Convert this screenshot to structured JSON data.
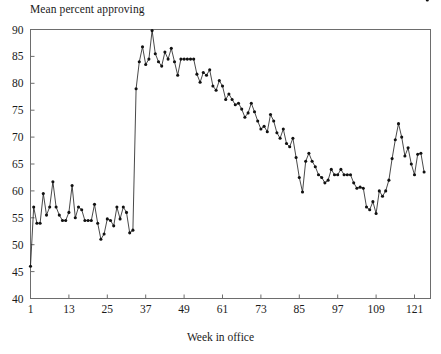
{
  "chart_data": {
    "type": "line",
    "title": "Mean percent approving",
    "xlabel": "Week in office",
    "ylabel": "",
    "grid": false,
    "legend": "none",
    "marker": "filled-circle",
    "xlim": [
      1,
      126
    ],
    "ylim": [
      40,
      90
    ],
    "xticks": [
      1,
      13,
      25,
      37,
      49,
      61,
      73,
      85,
      97,
      109,
      121
    ],
    "yticks": [
      40,
      45,
      50,
      55,
      60,
      65,
      70,
      75,
      80,
      85,
      90
    ],
    "x": [
      1,
      2,
      3,
      4,
      5,
      6,
      7,
      8,
      9,
      10,
      11,
      12,
      13,
      14,
      15,
      16,
      17,
      18,
      19,
      20,
      21,
      22,
      23,
      24,
      25,
      26,
      27,
      28,
      29,
      30,
      31,
      32,
      33,
      34,
      35,
      36,
      37,
      38,
      39,
      40,
      41,
      42,
      43,
      44,
      45,
      46,
      47,
      48,
      49,
      50,
      51,
      52,
      53,
      54,
      55,
      56,
      57,
      58,
      59,
      60,
      61,
      62,
      63,
      64,
      65,
      66,
      67,
      68,
      69,
      70,
      71,
      72,
      73,
      74,
      75,
      76,
      77,
      78,
      79,
      80,
      81,
      82,
      83,
      84,
      85,
      86,
      87,
      88,
      89,
      90,
      91,
      92,
      93,
      94,
      95,
      96,
      97,
      98,
      99,
      100,
      101,
      102,
      103,
      104,
      105,
      106,
      107,
      108,
      109,
      110,
      111,
      112,
      113,
      114,
      115,
      116,
      117,
      118,
      119,
      120,
      121,
      122,
      123,
      124,
      125
    ],
    "y": [
      46.0,
      57.0,
      54.0,
      54.0,
      59.5,
      55.5,
      57.0,
      61.7,
      57.0,
      55.5,
      54.5,
      54.5,
      56.0,
      61.0,
      55.0,
      57.0,
      56.5,
      54.5,
      54.5,
      54.5,
      57.5,
      54.0,
      51.0,
      52.0,
      54.8,
      54.5,
      53.5,
      57.0,
      54.8,
      57.0,
      56.0,
      52.2,
      52.7,
      79.0,
      84.0,
      86.8,
      83.5,
      84.5,
      89.8,
      85.5,
      84.0,
      83.2,
      85.8,
      84.5,
      86.5,
      84.0,
      81.5,
      84.5,
      84.5,
      84.5,
      84.5,
      84.5,
      81.7,
      80.2,
      82.0,
      81.5,
      82.5,
      79.5,
      78.7,
      80.5,
      79.5,
      77.0,
      78.0,
      77.0,
      76.0,
      76.3,
      75.2,
      73.7,
      74.5,
      76.3,
      74.7,
      73.0,
      71.5,
      72.0,
      71.0,
      74.2,
      73.0,
      70.8,
      69.8,
      71.5,
      68.8,
      68.2,
      69.8,
      66.2,
      62.5,
      59.8,
      65.5,
      67.0,
      65.5,
      64.5,
      63.0,
      62.5,
      61.5,
      62.0,
      64.0,
      63.0,
      63.0,
      64.0,
      63.0,
      63.0,
      63.0,
      61.5,
      60.5,
      60.7,
      60.5,
      57.0,
      56.5,
      58.0,
      55.8,
      60.0,
      59.0,
      60.0,
      62.0,
      66.0,
      69.5,
      72.5,
      70.0,
      66.5,
      68.0,
      65.0,
      63.0,
      66.8,
      67.0,
      63.5
    ]
  }
}
